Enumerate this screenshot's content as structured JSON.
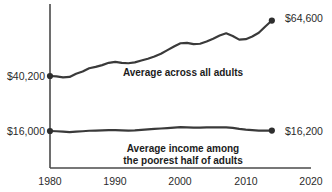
{
  "chart_data": {
    "type": "line",
    "title": "",
    "subtitle": "",
    "xlabel": "",
    "ylabel": "",
    "xlim": [
      1980,
      2020
    ],
    "ylim": [
      0,
      70000
    ],
    "grid": false,
    "legend_position": "inline-annotation",
    "x_ticks": [
      "1980",
      "1990",
      "2000",
      "2010",
      "2020"
    ],
    "x_tick_values": [
      1980,
      1990,
      2000,
      2010,
      2020
    ],
    "y_axis_labels": [
      {
        "text": "$40,200",
        "value": 40200,
        "series": "Average across all adults",
        "year": 1980
      },
      {
        "text": "$16,000",
        "value": 16000,
        "series": "Average income among the poorest half of adults",
        "year": 1980
      }
    ],
    "end_labels": [
      {
        "text": "$64,600",
        "value": 64600,
        "series": "Average across all adults",
        "year": 2014
      },
      {
        "text": "$16,200",
        "value": 16200,
        "series": "Average income among the poorest half of adults",
        "year": 2014
      }
    ],
    "annotations": [
      {
        "text": "Average across all adults",
        "lines": [
          "Average across all adults"
        ]
      },
      {
        "text": "Average income among the poorest half of adults",
        "lines": [
          "Average income among",
          "the poorest half of adults"
        ]
      }
    ],
    "series": [
      {
        "name": "Average across all adults",
        "x": [
          1980,
          1981,
          1982,
          1983,
          1984,
          1985,
          1986,
          1987,
          1988,
          1989,
          1990,
          1991,
          1992,
          1993,
          1994,
          1995,
          1996,
          1997,
          1998,
          1999,
          2000,
          2001,
          2002,
          2003,
          2004,
          2005,
          2006,
          2007,
          2008,
          2009,
          2010,
          2011,
          2012,
          2013,
          2014
        ],
        "values": [
          40200,
          40000,
          39600,
          39800,
          41200,
          42200,
          43600,
          44200,
          45000,
          46000,
          46400,
          46000,
          45800,
          46200,
          47000,
          47800,
          48800,
          50000,
          51600,
          53200,
          54600,
          54800,
          54200,
          54400,
          55400,
          56600,
          58000,
          59000,
          57800,
          56200,
          56400,
          57600,
          59200,
          62000,
          64600
        ],
        "color": "#3a3a3a",
        "start_marker": true,
        "end_marker": true
      },
      {
        "name": "Average income among the poorest half of adults",
        "x": [
          1980,
          1981,
          1982,
          1983,
          1984,
          1985,
          1986,
          1987,
          1988,
          1989,
          1990,
          1991,
          1992,
          1993,
          1994,
          1995,
          1996,
          1997,
          1998,
          1999,
          2000,
          2001,
          2002,
          2003,
          2004,
          2005,
          2006,
          2007,
          2008,
          2009,
          2010,
          2011,
          2012,
          2013,
          2014
        ],
        "values": [
          16000,
          15900,
          15700,
          15500,
          15700,
          15900,
          16100,
          16200,
          16300,
          16400,
          16400,
          16300,
          16200,
          16300,
          16500,
          16700,
          16900,
          17100,
          17300,
          17500,
          17700,
          17600,
          17500,
          17500,
          17600,
          17600,
          17600,
          17600,
          17400,
          16900,
          16600,
          16400,
          16200,
          16200,
          16200
        ],
        "color": "#3a3a3a",
        "start_marker": true,
        "end_marker": true
      }
    ]
  }
}
